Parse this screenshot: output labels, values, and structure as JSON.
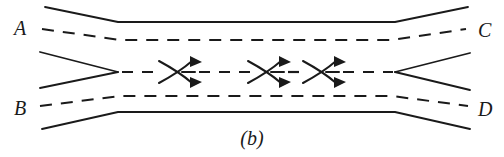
{
  "figure": {
    "caption": "(b)",
    "stroke_color": "#1a1a1a",
    "background_color": "#ffffff",
    "labels": {
      "top_left": "A",
      "bottom_left": "B",
      "top_right": "C",
      "bottom_right": "D"
    },
    "icons": {
      "crossing_arrow": "crossing-flow-arrow-icon",
      "inlet_wedge": "inlet-wedge-icon",
      "outlet_wedge": "outlet-wedge-icon"
    },
    "geometry": {
      "width": 504,
      "height": 157,
      "centerline_y": 72,
      "duct_left_bend_x": 118,
      "duct_right_bend_x": 395,
      "top_wall_y": 22,
      "bottom_wall_y": 112,
      "top_dash_y": 34,
      "bottom_dash_y": 100,
      "crossing_symbol_x": [
        178,
        267,
        322
      ]
    }
  }
}
